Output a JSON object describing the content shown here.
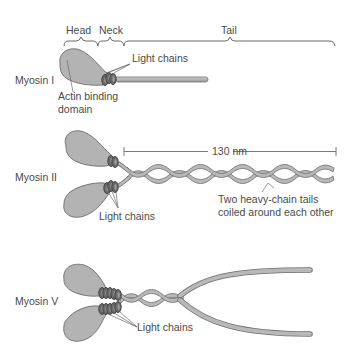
{
  "figure": {
    "colors": {
      "head_fill": "#b3b3b3",
      "head_stroke": "#6b6b6b",
      "light_chain": "#555555",
      "tail_fill": "#b8b8b8",
      "tail_stroke": "#6e6e6e",
      "line": "#6b6b6b",
      "text": "#4a4a4a"
    },
    "top_labels": {
      "head": "Head",
      "neck": "Neck",
      "tail": "Tail"
    },
    "myosin1": {
      "name": "Myosin I",
      "light_chains_label": "Light chains",
      "actin_label_line1": "Actin binding",
      "actin_label_line2": "domain"
    },
    "myosin2": {
      "name": "Myosin II",
      "length_label": "130 nm",
      "light_chains_label": "Light chains",
      "tails_label_line1": "Two heavy-chain tails",
      "tails_label_line2": "coiled around each other"
    },
    "myosin5": {
      "name": "Myosin V",
      "light_chains_label": "Light chains"
    }
  }
}
